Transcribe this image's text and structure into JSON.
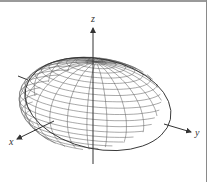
{
  "figure": {
    "type": "ellipsoid-wireframe",
    "axes": {
      "x_label": "x",
      "y_label": "y",
      "z_label": "z"
    },
    "colors": {
      "mesh": "#444444",
      "axis": "#333333",
      "border": "#9a9a9a"
    }
  }
}
